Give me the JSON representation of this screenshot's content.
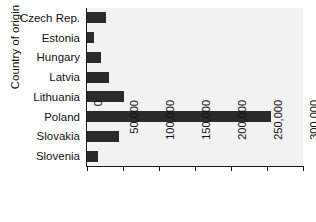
{
  "chart_data": {
    "type": "bar",
    "orientation": "horizontal",
    "title": "",
    "xlabel": "",
    "ylabel": "Country of origin",
    "categories": [
      "Czech Rep.",
      "Estonia",
      "Hungary",
      "Latvia",
      "Lithuania",
      "Poland",
      "Slovakia",
      "Slovenia"
    ],
    "values": [
      27000,
      10000,
      20000,
      31000,
      52000,
      255000,
      44000,
      15000
    ],
    "xlim": [
      0,
      300000
    ],
    "xticks": [
      0,
      50000,
      100000,
      150000,
      200000,
      250000,
      300000
    ],
    "xticklabels": [
      "0",
      "50,000",
      "100,000",
      "150,000",
      "200,000",
      "250,000",
      "300,000"
    ],
    "grid": false,
    "legend": null,
    "bar_color": "#2b2b2b",
    "panel_color": "#f2f2f2",
    "axis_color": "#1a1a1a"
  }
}
